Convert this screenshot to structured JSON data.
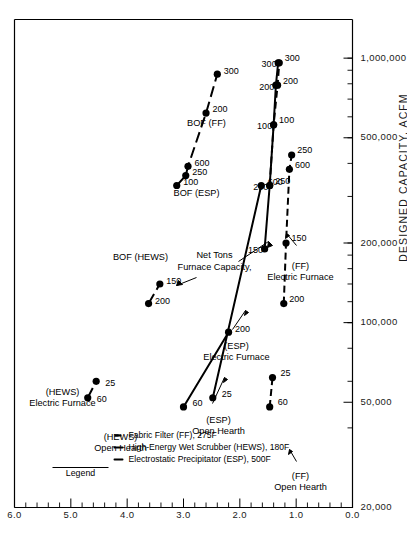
{
  "figure": {
    "orientation": "rotated-90-ccw",
    "background": "#ffffff",
    "ink": "#000000"
  },
  "legend": {
    "title": "Legend",
    "entries": [
      {
        "label": "Electrostatic Precipitator (ESP), 500F",
        "style": "solid",
        "key": "ESP"
      },
      {
        "label": "High-Energy Wet Scrubber (HEWS), 180F",
        "style": "solid",
        "key": "HEWS"
      },
      {
        "label": "Fabric Filter (FF), 275F",
        "style": "dashed",
        "key": "FF"
      }
    ]
  },
  "annotations": [
    {
      "name": "furnace-capacity-note",
      "line1": "Furnace Capacity,",
      "line2": "Net Tons"
    }
  ],
  "chart_data": {
    "type": "line",
    "title": "",
    "subtitle": "",
    "xlabel": "DESIGNED CAPACITY, ACFM",
    "ylabel": "",
    "xscale": "log",
    "yscale": "linear",
    "xlim": [
      20000,
      1400000
    ],
    "ylim": [
      0.0,
      6.0
    ],
    "grid": false,
    "legend_position": "top-left",
    "xticks": [
      20000,
      50000,
      100000,
      200000,
      500000,
      1000000
    ],
    "xticklabels": [
      "20,000",
      "50,000",
      "100,000",
      "200,000",
      "500,000",
      "1,000,000"
    ],
    "yticks": [
      0.0,
      1.0,
      2.0,
      3.0,
      4.0,
      5.0,
      6.0
    ],
    "yticklabels": [
      "0.0",
      "1.0",
      "2.0",
      "3.0",
      "4.0",
      "5.0",
      "6.0"
    ],
    "point_label_note": "Numbers beside each point are Furnace Capacity in Net Tons",
    "series": [
      {
        "name": "Open Hearth (HEWS)",
        "style": "solid",
        "label_line1": "Open Hearth",
        "label_line2": "(HEWS)",
        "points": [
          {
            "capacity": 60,
            "x": 52000,
            "y": 4.7
          },
          {
            "capacity": 25,
            "x": 60000,
            "y": 4.55
          }
        ]
      },
      {
        "name": "Electric Furnace (HEWS)",
        "style": "solid",
        "label_line1": "Electric Furnace",
        "label_line2": "(HEWS)",
        "points": [
          {
            "capacity": 200,
            "x": 118000,
            "y": 3.62
          },
          {
            "capacity": 150,
            "x": 140000,
            "y": 3.42
          }
        ]
      },
      {
        "name": "BOF (HEWS)",
        "style": "solid",
        "label_line1": "BOF (HEWS)",
        "label_line2": "",
        "points": [
          {
            "capacity": 100,
            "x": 330000,
            "y": 3.12
          },
          {
            "capacity": 250,
            "x": 360000,
            "y": 2.96
          },
          {
            "capacity": 600,
            "x": 390000,
            "y": 2.92
          },
          {
            "capacity": 200,
            "x": 620000,
            "y": 2.6
          },
          {
            "capacity": 300,
            "x": 870000,
            "y": 2.4
          }
        ]
      },
      {
        "name": "Open Hearth (ESP)",
        "style": "solid",
        "label_line1": "Open Hearth",
        "label_line2": "(ESP)",
        "points": [
          {
            "capacity": 60,
            "x": 48000,
            "y": 3.0
          },
          {
            "capacity": 200,
            "x": 92000,
            "y": 2.2
          }
        ]
      },
      {
        "name": "Electric Furnace (ESP)",
        "style": "solid",
        "label_line1": "Electric Furnace",
        "label_line2": "(ESP)",
        "points": [
          {
            "capacity": 25,
            "x": 52000,
            "y": 2.48
          },
          {
            "capacity": 600,
            "x": 330000,
            "y": 1.62
          }
        ]
      },
      {
        "name": "BOF (ESP)",
        "style": "solid",
        "label_line1": "BOF (ESP)",
        "label_line2": "",
        "points": [
          {
            "capacity": 150,
            "x": 190000,
            "y": 1.56
          },
          {
            "capacity": 250,
            "x": 330000,
            "y": 1.47
          },
          {
            "capacity": 100,
            "x": 560000,
            "y": 1.4
          },
          {
            "capacity": 200,
            "x": 790000,
            "y": 1.36
          },
          {
            "capacity": 300,
            "x": 960000,
            "y": 1.32
          }
        ]
      },
      {
        "name": "Open Hearth (FF)",
        "style": "dashed",
        "label_line1": "Open Hearth",
        "label_line2": "(FF)",
        "points": [
          {
            "capacity": 60,
            "x": 48000,
            "y": 1.47
          },
          {
            "capacity": 25,
            "x": 62000,
            "y": 1.42
          }
        ]
      },
      {
        "name": "Electric Furnace (FF)",
        "style": "dashed",
        "label_line1": "Electric Furnace",
        "label_line2": "(FF)",
        "points": [
          {
            "capacity": 200,
            "x": 118000,
            "y": 1.22
          },
          {
            "capacity": 150,
            "x": 200000,
            "y": 1.18
          },
          {
            "capacity": 600,
            "x": 380000,
            "y": 1.12
          },
          {
            "capacity": 250,
            "x": 430000,
            "y": 1.08
          }
        ]
      },
      {
        "name": "BOF (FF)",
        "style": "dashed",
        "label_line1": "BOF (FF)",
        "label_line2": "",
        "points": [
          {
            "capacity": 250,
            "x": 330000,
            "y": 1.47
          },
          {
            "capacity": 100,
            "x": 560000,
            "y": 1.4
          },
          {
            "capacity": 200,
            "x": 790000,
            "y": 1.33
          },
          {
            "capacity": 300,
            "x": 960000,
            "y": 1.3
          }
        ]
      }
    ]
  }
}
